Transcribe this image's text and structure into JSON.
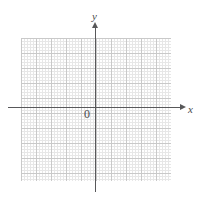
{
  "figure": {
    "name": "cartesian-coordinate-plane",
    "background_color": "#ffffff"
  },
  "axes": {
    "x_label": "x",
    "y_label": "y",
    "origin_label": "0",
    "axis_color": "#58585a",
    "label_color": "#4a4a4c"
  },
  "grid": {
    "major_color": "#c9c9c9",
    "minor_color": "#e3e3e3",
    "major_cell_px": 15,
    "minor_cell_px": 3,
    "columns": 10,
    "rows": 10
  },
  "chart_data": {
    "type": "scatter",
    "title": "",
    "subtitle": "",
    "xlabel": "x",
    "ylabel": "y",
    "origin_label": "0",
    "xlim": [
      -5,
      6
    ],
    "ylim": [
      -5,
      5
    ],
    "x_ticks": [
      -5,
      -4,
      -3,
      -2,
      -1,
      0,
      1,
      2,
      3,
      4,
      5,
      6
    ],
    "y_ticks": [
      -5,
      -4,
      -3,
      -2,
      -1,
      0,
      1,
      2,
      3,
      4,
      5
    ],
    "x_tick_labels": [],
    "y_tick_labels": [],
    "grid": true,
    "minor_grid": true,
    "legend": false,
    "series": [
      {
        "name": "",
        "x": [],
        "y": []
      }
    ],
    "annotations": []
  }
}
